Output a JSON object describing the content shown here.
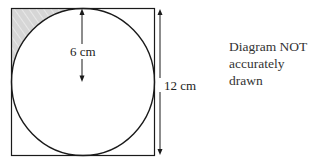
{
  "diagram": {
    "shapes": {
      "square": {
        "side_label": "12 cm"
      },
      "circle": {
        "radius_label": "6 cm"
      },
      "shaded_region": "top-left corner between square and circle"
    },
    "labels": {
      "radius": "6 cm",
      "side": "12 cm"
    },
    "note": {
      "line1": "Diagram NOT",
      "line2": "accurately drawn"
    },
    "colors": {
      "stroke": "#1a1a1a",
      "shade": "#d4d4d4",
      "background": "#ffffff"
    }
  }
}
